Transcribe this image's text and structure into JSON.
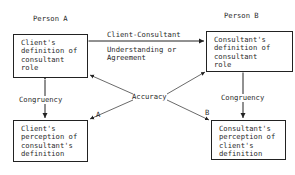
{
  "persons": {
    "a": "Person A",
    "b": "Person B"
  },
  "boxes": {
    "client_definition": "Client's\ndefinition of\nconsultant\nrole",
    "consultant_definition": "Consultant's\ndefinition of\nconsultant\nrole",
    "client_perception": "Client's\nperception of\nconsultant's\ndefinition",
    "consultant_perception": "Consultant's\nperception of\nclient's\ndefinition"
  },
  "labels": {
    "agreement_top": "Client-Consultant",
    "agreement_bottom": "Understanding or\nAgreement",
    "congruency_left": "Congruency",
    "congruency_right": "Congruency",
    "accuracy": "Accuracy",
    "marker_a": "A",
    "marker_b": "B"
  }
}
